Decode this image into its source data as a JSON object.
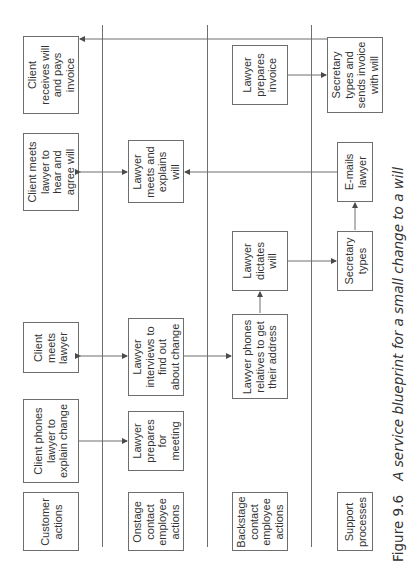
{
  "figure": {
    "number": "Figure 9.6",
    "title": "A service blueprint for a small change to a will"
  },
  "lanes": [
    {
      "label": "Customer\nactions"
    },
    {
      "label": "Onstage\ncontact\nemployee\nactions"
    },
    {
      "label": "Backstage\ncontact\nemployee\nactions"
    },
    {
      "label": "Support\nprocesses"
    }
  ],
  "steps": {
    "customer": [
      {
        "label": "Client phones\nlawyer to\nexplain change"
      },
      {
        "label": "Client\nmeets\nlawyer"
      },
      {
        "label": "Client meets\nlawyer to\nhear and\nagree will"
      },
      {
        "label": "Client\nreceives will\nand pays\ninvoice"
      }
    ],
    "onstage": [
      {
        "label": "Lawyer\nprepares\nfor\nmeeting"
      },
      {
        "label": "Lawyer\ninterviews to\nfind out\nabout change"
      },
      {
        "label": "Lawyer\nmeets and\nexplains\nwill"
      }
    ],
    "backstage": [
      {
        "label": "Lawyer phones\nrelatives to get\ntheir address"
      },
      {
        "label": "Lawyer\ndictates\nwill"
      },
      {
        "label": "Lawyer\nprepares\ninvoice"
      }
    ],
    "support": [
      {
        "label": "Secretary\ntypes"
      },
      {
        "label": "E-mails\nlawyer"
      },
      {
        "label": "Secretary\ntypes and\nsends invoice\nwith will"
      }
    ]
  },
  "flows": [
    {
      "from": "Client phones lawyer to explain change",
      "to": "Lawyer prepares for meeting",
      "type": "arrow"
    },
    {
      "from": "Client meets lawyer",
      "to": "Lawyer interviews to find out about change",
      "type": "bidirectional"
    },
    {
      "from": "Lawyer interviews to find out about change",
      "to": "Lawyer phones relatives to get their address",
      "type": "arrow"
    },
    {
      "from": "Lawyer phones relatives to get their address",
      "to": "Lawyer dictates will",
      "type": "arrow"
    },
    {
      "from": "Lawyer dictates will",
      "to": "Secretary types",
      "type": "arrow"
    },
    {
      "from": "Secretary types",
      "to": "E-mails lawyer",
      "type": "arrow"
    },
    {
      "from": "E-mails lawyer",
      "to": "Lawyer meets and explains will",
      "type": "arrow"
    },
    {
      "from": "Client meets lawyer to hear and agree will",
      "to": "Lawyer meets and explains will",
      "type": "bidirectional"
    },
    {
      "from": "Lawyer prepares invoice",
      "to": "Secretary types and sends invoice with will",
      "type": "arrow"
    },
    {
      "from": "Secretary types and sends invoice with will",
      "to": "Client receives will and pays invoice",
      "type": "arrow"
    }
  ],
  "colors": {
    "line": "#6e6e6e",
    "text": "#333333",
    "background": "#ffffff"
  }
}
